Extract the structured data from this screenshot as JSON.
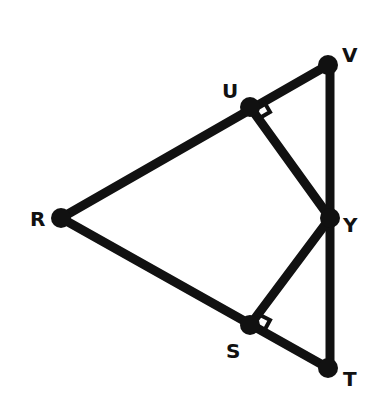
{
  "diagram": {
    "type": "geometry",
    "stroke_color": "#111111",
    "background": "#ffffff",
    "points": {
      "R": {
        "label": "R",
        "x": 61,
        "y": 218
      },
      "U": {
        "label": "U",
        "x": 250,
        "y": 107
      },
      "V": {
        "label": "V",
        "x": 328,
        "y": 65
      },
      "Y": {
        "label": "Y",
        "x": 330,
        "y": 218
      },
      "S": {
        "label": "S",
        "x": 250,
        "y": 325
      },
      "T": {
        "label": "T",
        "x": 328,
        "y": 368
      }
    },
    "segments": [
      "RV",
      "RT",
      "VT",
      "UY",
      "SY"
    ],
    "right_angles": [
      "at U between UV and UY",
      "at S between ST and SY"
    ]
  }
}
